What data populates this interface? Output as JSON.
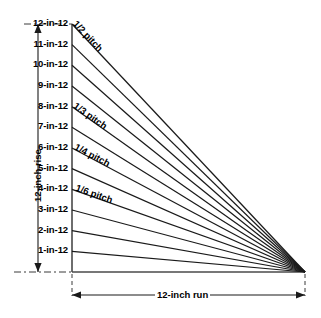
{
  "diagram": {
    "vertical_dimension_label": "12-inch rise",
    "horizontal_dimension_label": "12-inch run",
    "line_color": "#1a1a1a",
    "background_color": "#ffffff",
    "text_color": "#000000",
    "slope_labels": [
      {
        "id": "slope-12",
        "text": "12-in-12",
        "rise": 12
      },
      {
        "id": "slope-11",
        "text": "11-in-12",
        "rise": 11
      },
      {
        "id": "slope-10",
        "text": "10-in-12",
        "rise": 10
      },
      {
        "id": "slope-9",
        "text": "9-in-12",
        "rise": 9
      },
      {
        "id": "slope-8",
        "text": "8-in-12",
        "rise": 8
      },
      {
        "id": "slope-7",
        "text": "7-in-12",
        "rise": 7
      },
      {
        "id": "slope-6",
        "text": "6-in-12",
        "rise": 6
      },
      {
        "id": "slope-5",
        "text": "5-in-12",
        "rise": 5
      },
      {
        "id": "slope-4",
        "text": "4-in-12",
        "rise": 4
      },
      {
        "id": "slope-3",
        "text": "3-in-12",
        "rise": 3
      },
      {
        "id": "slope-2",
        "text": "2-in-12",
        "rise": 2
      },
      {
        "id": "slope-1",
        "text": "1-in-12",
        "rise": 1
      }
    ],
    "pitch_labels": [
      {
        "id": "pitch-one-half",
        "text": "1/2 pitch",
        "on_slope": 12
      },
      {
        "id": "pitch-one-third",
        "text": "1/3 pitch",
        "on_slope": 8
      },
      {
        "id": "pitch-one-quarter",
        "text": "1/4 pitch",
        "on_slope": 6
      },
      {
        "id": "pitch-one-sixth",
        "text": "1/6 pitch",
        "on_slope": 4
      }
    ]
  }
}
